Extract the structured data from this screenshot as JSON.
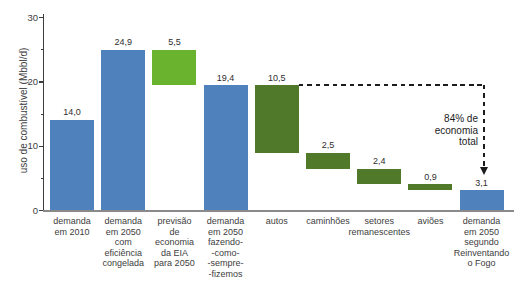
{
  "chart_data": {
    "type": "bar",
    "subtype": "waterfall",
    "title": "",
    "xlabel": "",
    "ylabel": "uso de combustível (Mbbl/d)",
    "ylim": [
      0,
      30
    ],
    "grid": false,
    "legend": false,
    "yticks_major": [
      {
        "value": 0,
        "label": "0"
      },
      {
        "value": 10,
        "label": "10"
      },
      {
        "value": 20,
        "label": "20"
      },
      {
        "value": 30,
        "label": "30"
      }
    ],
    "yticks_minor": [
      5,
      15,
      25
    ],
    "colors": {
      "blue": "#4f81bd",
      "bright_green": "#6ab32e",
      "dark_green": "#507a29"
    },
    "bars": [
      {
        "category_lines": [
          "demanda",
          "em 2010"
        ],
        "value": 14.0,
        "value_label": "14,0",
        "base": 0,
        "top": 14.0,
        "color": "blue"
      },
      {
        "category_lines": [
          "demanda",
          "em 2050",
          "com",
          "eficiência",
          "congelada"
        ],
        "value": 24.9,
        "value_label": "24,9",
        "base": 0,
        "top": 24.9,
        "color": "blue"
      },
      {
        "category_lines": [
          "previsão",
          "de",
          "economia",
          "da EIA",
          "para 2050"
        ],
        "value": 5.5,
        "value_label": "5,5",
        "base": 19.4,
        "top": 24.9,
        "color": "bright_green"
      },
      {
        "category_lines": [
          "demanda",
          "em 2050",
          "fazendo-",
          "-como-",
          "-sempre-",
          "-fizemos"
        ],
        "value": 19.4,
        "value_label": "19,4",
        "base": 0,
        "top": 19.4,
        "color": "blue"
      },
      {
        "category_lines": [
          "autos"
        ],
        "value": 10.5,
        "value_label": "10,5",
        "base": 8.9,
        "top": 19.4,
        "color": "dark_green"
      },
      {
        "category_lines": [
          "caminhões"
        ],
        "value": 2.5,
        "value_label": "2,5",
        "base": 6.4,
        "top": 8.9,
        "color": "dark_green"
      },
      {
        "category_lines": [
          "setores",
          "remanescentes"
        ],
        "value": 2.4,
        "value_label": "2,4",
        "base": 4.0,
        "top": 6.4,
        "color": "dark_green"
      },
      {
        "category_lines": [
          "aviões"
        ],
        "value": 0.9,
        "value_label": "0,9",
        "base": 3.1,
        "top": 4.0,
        "color": "dark_green"
      },
      {
        "category_lines": [
          "demanda",
          "em 2050",
          "segundo",
          "Reinventando",
          "o Fogo"
        ],
        "value": 3.1,
        "value_label": "3,1",
        "base": 0,
        "top": 3.1,
        "color": "blue"
      }
    ],
    "annotation": {
      "lines": [
        "84% de",
        "economia",
        "total"
      ],
      "level": 19.4,
      "from_bar_index": 4,
      "points_to_bar_index": 8
    }
  }
}
